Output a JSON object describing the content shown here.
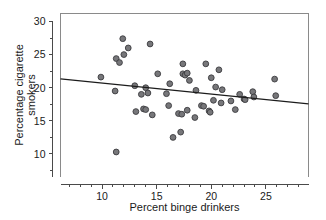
{
  "chart_data": {
    "type": "scatter",
    "title": "",
    "xlabel": "Percent binge drinkers",
    "ylabel_line1": "Percentage cigarette",
    "ylabel_line2": "smokers",
    "ylabel": "Percentage cigarette smokers",
    "xlim": [
      6.2,
      28.9
    ],
    "ylim": [
      6.6,
      31.2
    ],
    "xticks": [
      10,
      15,
      20,
      25
    ],
    "xtick_labels": [
      "10",
      "15",
      "20",
      "25"
    ],
    "x_minor_ticks": [
      7,
      8,
      9,
      11,
      12,
      13,
      14,
      16,
      17,
      18,
      19,
      21,
      22,
      23,
      24,
      26,
      27,
      28
    ],
    "yticks": [
      10,
      15,
      20,
      25,
      30
    ],
    "ytick_labels": [
      "10",
      "15",
      "20",
      "25",
      "30"
    ],
    "y_minor_ticks": [
      7.5,
      12.5,
      17.5,
      22.5,
      27.5
    ],
    "grid": false,
    "legend": false,
    "legend_position": "none",
    "point_color": "#77777a",
    "point_edge_color": "#3b3b3e",
    "line_color": "#1c1c1c",
    "axis_color": "#4a4a4a",
    "series": [
      {
        "name": "states",
        "points": [
          [
            9.9,
            21.6
          ],
          [
            11.2,
            19.5
          ],
          [
            11.3,
            24.4
          ],
          [
            11.3,
            10.3
          ],
          [
            11.6,
            23.8
          ],
          [
            11.9,
            27.4
          ],
          [
            12.0,
            25.0
          ],
          [
            12.4,
            26.0
          ],
          [
            13.0,
            20.3
          ],
          [
            13.1,
            16.4
          ],
          [
            13.6,
            19.0
          ],
          [
            13.8,
            16.8
          ],
          [
            14.0,
            16.7
          ],
          [
            14.0,
            20.0
          ],
          [
            14.2,
            19.2
          ],
          [
            14.4,
            26.6
          ],
          [
            14.6,
            15.9
          ],
          [
            15.1,
            22.1
          ],
          [
            15.9,
            19.1
          ],
          [
            16.1,
            17.3
          ],
          [
            16.2,
            20.6
          ],
          [
            16.5,
            12.5
          ],
          [
            17.0,
            16.1
          ],
          [
            17.2,
            13.3
          ],
          [
            17.3,
            16.0
          ],
          [
            17.4,
            22.1
          ],
          [
            17.4,
            23.6
          ],
          [
            17.6,
            21.9
          ],
          [
            17.8,
            22.2
          ],
          [
            17.8,
            16.6
          ],
          [
            18.0,
            21.1
          ],
          [
            18.5,
            15.5
          ],
          [
            18.6,
            19.6
          ],
          [
            19.1,
            17.3
          ],
          [
            19.3,
            17.2
          ],
          [
            19.5,
            23.6
          ],
          [
            19.8,
            16.5
          ],
          [
            19.9,
            16.3
          ],
          [
            20.0,
            21.5
          ],
          [
            20.2,
            18.1
          ],
          [
            20.4,
            20.1
          ],
          [
            20.7,
            22.7
          ],
          [
            20.9,
            17.7
          ],
          [
            21.0,
            19.7
          ],
          [
            21.8,
            18.0
          ],
          [
            22.2,
            16.7
          ],
          [
            22.6,
            19.0
          ],
          [
            23.0,
            18.3
          ],
          [
            23.1,
            18.2
          ],
          [
            23.8,
            19.4
          ],
          [
            23.9,
            18.6
          ],
          [
            25.8,
            21.3
          ],
          [
            25.9,
            18.8
          ]
        ]
      }
    ],
    "fit_line": {
      "name": "linear-fit",
      "x_start": 6.2,
      "y_start": 21.35,
      "x_end": 28.9,
      "y_end": 17.55,
      "slope": -0.167,
      "intercept": 22.39
    }
  }
}
